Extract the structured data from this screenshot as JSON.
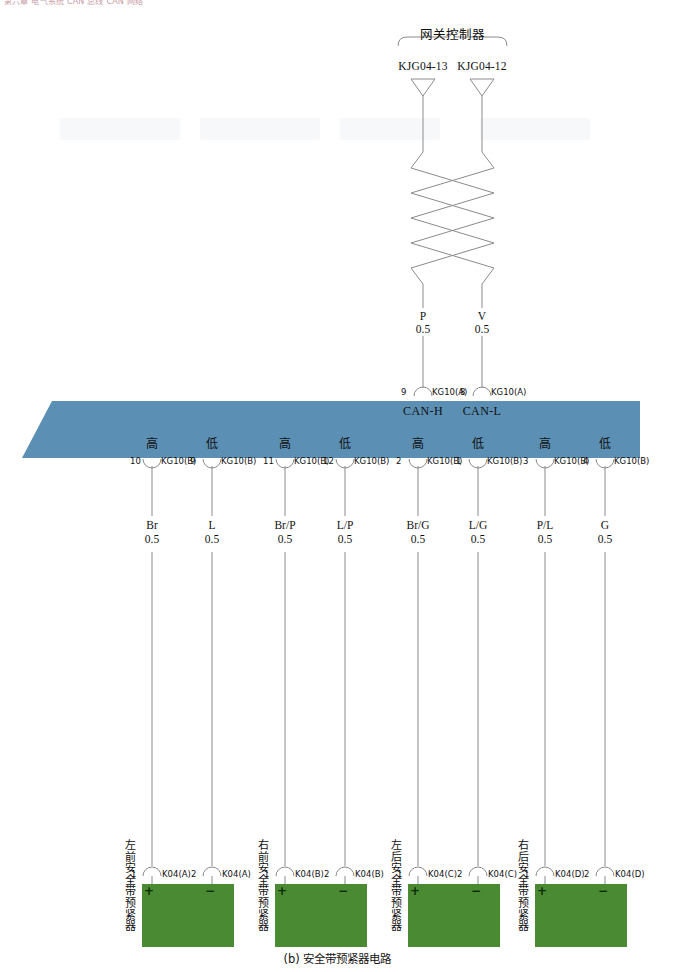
{
  "header": {
    "strip_text": "第六章 电气系统  CAN 总线  CAN 网络"
  },
  "figure": {
    "caption": "(b) 安全带预紧器电路"
  },
  "gateway": {
    "title": "网关控制器",
    "terminals": [
      {
        "label": "KJG04-13",
        "x": 423
      },
      {
        "label": "KJG04-12",
        "x": 482
      }
    ]
  },
  "twisted_pair": {
    "wires": [
      {
        "color_code": "P",
        "gauge": "0.5",
        "x": 423
      },
      {
        "color_code": "V",
        "gauge": "0.5",
        "x": 482
      }
    ]
  },
  "bus": {
    "color": "#5b8fb3",
    "top_connectors": [
      {
        "pin": "9",
        "connector": "KG10(A)",
        "signal": "CAN-H",
        "x": 423
      },
      {
        "pin": "8",
        "connector": "KG10(A)",
        "signal": "CAN-L",
        "x": 482
      }
    ],
    "bottom_connectors": [
      {
        "level": "高",
        "pin": "10",
        "connector": "KG10(B)",
        "x": 152
      },
      {
        "level": "低",
        "pin": "9",
        "connector": "KG10(B)",
        "x": 212
      },
      {
        "level": "高",
        "pin": "11",
        "connector": "KG10(B)",
        "x": 285
      },
      {
        "level": "低",
        "pin": "12",
        "connector": "KG10(B)",
        "x": 345
      },
      {
        "level": "高",
        "pin": "2",
        "connector": "KG10(B)",
        "x": 418
      },
      {
        "level": "低",
        "pin": "1",
        "connector": "KG10(B)",
        "x": 478
      },
      {
        "level": "高",
        "pin": "3",
        "connector": "KG10(B)",
        "x": 545
      },
      {
        "level": "低",
        "pin": "4",
        "connector": "KG10(B)",
        "x": 605
      }
    ]
  },
  "wires": [
    {
      "color_code": "Br",
      "gauge": "0.5",
      "x": 152
    },
    {
      "color_code": "L",
      "gauge": "0.5",
      "x": 212
    },
    {
      "color_code": "Br/P",
      "gauge": "0.5",
      "x": 285
    },
    {
      "color_code": "L/P",
      "gauge": "0.5",
      "x": 345
    },
    {
      "color_code": "Br/G",
      "gauge": "0.5",
      "x": 418
    },
    {
      "color_code": "L/G",
      "gauge": "0.5",
      "x": 478
    },
    {
      "color_code": "P/L",
      "gauge": "0.5",
      "x": 545
    },
    {
      "color_code": "G",
      "gauge": "0.5",
      "x": 605
    }
  ],
  "devices": [
    {
      "name": "左前安全带预紧器",
      "box_x": 142,
      "box_w": 92,
      "label_x": 124,
      "pins": [
        {
          "num": "1",
          "connector": "K04(A)",
          "polarity": "+",
          "x": 152
        },
        {
          "num": "2",
          "connector": "K04(A)",
          "polarity": "−",
          "x": 212
        }
      ]
    },
    {
      "name": "右前安全带预紧器",
      "box_x": 275,
      "box_w": 92,
      "label_x": 257,
      "pins": [
        {
          "num": "1",
          "connector": "K04(B)",
          "polarity": "+",
          "x": 285
        },
        {
          "num": "2",
          "connector": "K04(B)",
          "polarity": "−",
          "x": 345
        }
      ]
    },
    {
      "name": "左后安全带预紧器",
      "box_x": 408,
      "box_w": 92,
      "label_x": 390,
      "pins": [
        {
          "num": "1",
          "connector": "K04(C)",
          "polarity": "+",
          "x": 418
        },
        {
          "num": "2",
          "connector": "K04(C)",
          "polarity": "−",
          "x": 478
        }
      ]
    },
    {
      "name": "右后安全带预紧器",
      "box_x": 535,
      "box_w": 92,
      "label_x": 517,
      "pins": [
        {
          "num": "1",
          "connector": "K04(D)",
          "polarity": "+",
          "x": 545
        },
        {
          "num": "2",
          "connector": "K04(D)",
          "polarity": "−",
          "x": 605
        }
      ]
    }
  ]
}
